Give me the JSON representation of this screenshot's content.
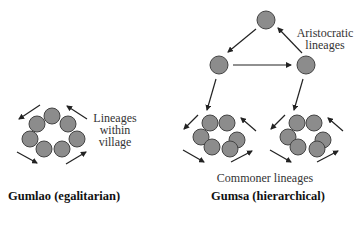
{
  "diagram": {
    "labels": {
      "aristocratic": [
        "Aristocratic",
        "lineages"
      ],
      "lineages_within": [
        "Lineages",
        "within",
        "village"
      ],
      "commoner": "Commoner lineages"
    },
    "titles": {
      "gumlao": "Gumlao (egalitarian)",
      "gumsa": "Gumsa (hierarchical)"
    },
    "colors": {
      "circle_fill": "#8c8c8c",
      "circle_stroke": "#444444",
      "arrow": "#222222"
    }
  }
}
